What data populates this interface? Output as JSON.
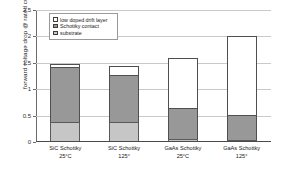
{
  "chart_data": {
    "type": "bar",
    "title": "",
    "subtitle": "",
    "stacked": true,
    "xlabel": "",
    "ylabel": "forward voltage drop @ rated current (V)",
    "ylim": [
      0,
      2.5
    ],
    "ytick_labels": [
      "0",
      "0.5",
      "1",
      "1.5",
      "2",
      "2.5"
    ],
    "ytick_values": [
      0,
      0.5,
      1,
      1.5,
      2,
      2.5
    ],
    "grid": true,
    "legend_position": "inside-top-left",
    "categories": [
      "SiC Schottky\n25°C",
      "SiC Schottky\n125°",
      "GaAs Schottky\n25°C",
      "GaAs Schottky\n125°"
    ],
    "category_lines": [
      [
        "SiC Schottky",
        "25°C"
      ],
      [
        "SiC Schottky",
        "125°"
      ],
      [
        "GaAs Schottky",
        "25°C"
      ],
      [
        "GaAs Schottky",
        "125°"
      ]
    ],
    "series": [
      {
        "name": "substrate",
        "color": "#c6c6c6",
        "values": [
          0.37,
          0.37,
          0.05,
          0.03
        ]
      },
      {
        "name": "Schottky contact",
        "color": "#989898",
        "values": [
          1.05,
          0.89,
          0.6,
          0.49
        ]
      },
      {
        "name": "low doped drift layer",
        "color": "#ffffff",
        "values": [
          0.06,
          0.18,
          0.95,
          1.49
        ]
      }
    ],
    "totals": [
      1.48,
      1.44,
      1.6,
      2.01
    ]
  },
  "legend": {
    "items": [
      {
        "label": "low doped drift layer",
        "swatch": "drift"
      },
      {
        "label": "Schottky contact",
        "swatch": "schottky"
      },
      {
        "label": "substrate",
        "swatch": "substrate"
      }
    ]
  },
  "colors": {
    "substrate": "#c6c6c6",
    "schottky": "#989898",
    "drift": "#ffffff",
    "grid": "#c9c9c9",
    "axis": "#6b6b6b"
  }
}
